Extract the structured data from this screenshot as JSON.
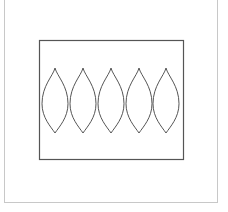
{
  "figure": {
    "colors": {
      "background": "#ffffff",
      "frame": "#c8c8c8",
      "rect_stroke": "#555555",
      "leaf_stroke": "#555555"
    },
    "rect": {
      "x": 39,
      "y": 40,
      "width": 144,
      "height": 119
    },
    "leaves": [
      {
        "cx": 55,
        "top": 68,
        "bottom": 133,
        "half_width": 13
      },
      {
        "cx": 83,
        "top": 68,
        "bottom": 133,
        "half_width": 13
      },
      {
        "cx": 111,
        "top": 68,
        "bottom": 133,
        "half_width": 13
      },
      {
        "cx": 139,
        "top": 68,
        "bottom": 133,
        "half_width": 13
      },
      {
        "cx": 166,
        "top": 68,
        "bottom": 133,
        "half_width": 13
      }
    ]
  }
}
